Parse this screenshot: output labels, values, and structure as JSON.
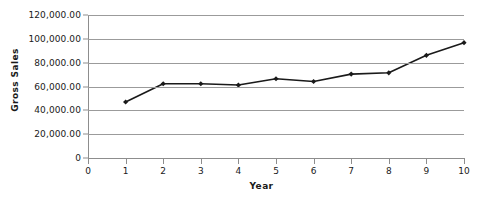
{
  "chart_data": {
    "type": "line",
    "title": "",
    "xlabel": "Year",
    "ylabel": "Gross Sales",
    "x": [
      1,
      2,
      3,
      4,
      5,
      6,
      7,
      8,
      9,
      10
    ],
    "values": [
      47000,
      62300,
      62300,
      61200,
      66500,
      64200,
      70400,
      71500,
      86200,
      96800
    ],
    "series": [
      {
        "name": "Gross Sales",
        "values": [
          47000,
          62300,
          62300,
          61200,
          66500,
          64200,
          70400,
          71500,
          86200,
          96800
        ]
      }
    ],
    "xlim": [
      0,
      10
    ],
    "ylim": [
      0,
      120000
    ],
    "x_tick_labels": [
      "0",
      "1",
      "2",
      "3",
      "4",
      "5",
      "6",
      "7",
      "8",
      "9",
      "10"
    ],
    "x_tick_values": [
      0,
      1,
      2,
      3,
      4,
      5,
      6,
      7,
      8,
      9,
      10
    ],
    "y_tick_labels": [
      "0",
      "20,000.00",
      "40,000.00",
      "60,000.00",
      "80,000.00",
      "100,000.00",
      "120,000.00"
    ],
    "y_tick_values": [
      0,
      20000,
      40000,
      60000,
      80000,
      100000,
      120000
    ],
    "grid": true,
    "grid_axis": "y",
    "legend": false,
    "legend_position": "none",
    "marker": "diamond",
    "line_color": "#1a1a1a",
    "marker_color": "#1a1a1a",
    "grid_color": "#9b9b9b",
    "axis_color": "#8d8d8d",
    "background_color": "#ffffff"
  }
}
